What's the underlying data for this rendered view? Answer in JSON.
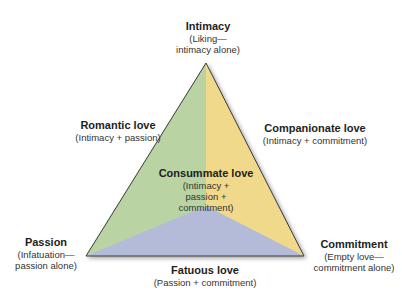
{
  "diagram": {
    "colors": {
      "intimacy_passion_region": "#b9d3a3",
      "intimacy_commitment_region": "#f0d98a",
      "passion_commitment_region": "#b3bbd8",
      "edge": "#3a3a3a"
    },
    "vertices": {
      "top": {
        "title": "Intimacy",
        "sub1": "(Liking—",
        "sub2": "intimacy alone)"
      },
      "left": {
        "title": "Passion",
        "sub1": "(Infatuation—",
        "sub2": "passion alone)"
      },
      "right": {
        "title": "Commitment",
        "sub1": "(Empty love—",
        "sub2": "commitment alone)"
      }
    },
    "sides": {
      "left": {
        "title": "Romantic love",
        "sub1": "(Intimacy + passion)"
      },
      "right": {
        "title": "Companionate love",
        "sub1": "(Intimacy + commitment)"
      },
      "bottom": {
        "title": "Fatuous love",
        "sub1": "(Passion + commitment)"
      }
    },
    "center": {
      "title": "Consummate love",
      "sub1": "(Intimacy +",
      "sub2": "passion +",
      "sub3": "commitment)"
    }
  }
}
